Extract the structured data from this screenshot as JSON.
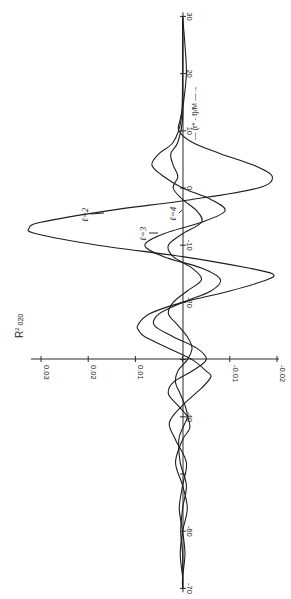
{
  "chart_data": {
    "type": "line",
    "orientation": "rotated-90-clockwise",
    "title": "",
    "xlabel": "(r* - t)/M",
    "xlabel_arrow": "→",
    "ylabel": "R² ω₂₀",
    "ylabel_display": {
      "base": "R",
      "sup": "2",
      "rest": " 020"
    },
    "xlim": [
      -70,
      30
    ],
    "ylim": [
      -0.02,
      0.03
    ],
    "x_ticks": [
      30,
      20,
      10,
      0,
      -10,
      -20,
      -30,
      -40,
      -50,
      -60,
      -70
    ],
    "x_tick_labels": [
      "30",
      "20",
      "10",
      "0",
      "-10",
      "-20",
      "",
      "-40",
      "",
      "-60",
      "-70"
    ],
    "y_ticks": [
      0.03,
      0.02,
      0.01,
      0,
      -0.01,
      -0.02
    ],
    "y_tick_labels": [
      "0.03",
      "0.02",
      "0.01",
      "",
      "-0.01",
      "-0.02"
    ],
    "grid": false,
    "legend": "inline annotations",
    "annotations": [
      {
        "text": "ℓ=2",
        "series": "l=2",
        "x": -5,
        "y": 0.017
      },
      {
        "text": "ℓ=3",
        "series": "l=3",
        "x": -9,
        "y": 0.0075
      },
      {
        "text": "ℓ=4",
        "series": "l=4",
        "x": -3,
        "y": 0.0025
      }
    ],
    "series": [
      {
        "name": "l=2",
        "x": [
          30,
          25,
          20,
          15,
          12,
          10,
          8,
          6,
          4,
          2,
          0,
          -2,
          -4,
          -6,
          -7,
          -8,
          -10,
          -12,
          -14,
          -15,
          -16,
          -18,
          -20,
          -22,
          -24,
          -25,
          -26,
          -28,
          -30,
          -32,
          -33,
          -35,
          -38,
          -41,
          -44,
          -48,
          -52,
          -56,
          -60,
          -64,
          -68,
          -70
        ],
        "y": [
          0.0,
          -0.0005,
          -0.0008,
          -0.0002,
          0.0005,
          0.0008,
          -0.002,
          -0.008,
          -0.015,
          -0.019,
          -0.016,
          -0.002,
          0.016,
          0.03,
          0.0325,
          0.031,
          0.018,
          0.0,
          -0.014,
          -0.019,
          -0.018,
          -0.01,
          0.0,
          0.007,
          0.0095,
          0.0092,
          0.008,
          0.003,
          -0.002,
          -0.005,
          -0.006,
          -0.004,
          0.0,
          0.0028,
          0.0015,
          -0.0008,
          0.0,
          0.0007,
          0.0,
          -0.0005,
          0.0,
          0.0
        ]
      },
      {
        "name": "l=3",
        "x": [
          30,
          20,
          12,
          8,
          6,
          4,
          2,
          0,
          -2,
          -4,
          -6,
          -8,
          -10,
          -12,
          -14,
          -16,
          -18,
          -20,
          -22,
          -24,
          -26,
          -28,
          -30,
          -32,
          -34,
          -36,
          -38,
          -40,
          -42,
          -44,
          -48,
          -52,
          -56,
          -60,
          -64,
          -68,
          -70
        ],
        "y": [
          0.0,
          0.0,
          0.0003,
          0.002,
          0.005,
          0.0065,
          0.004,
          0.0,
          -0.006,
          -0.009,
          -0.004,
          0.004,
          0.008,
          0.004,
          -0.004,
          -0.008,
          -0.006,
          0.0,
          0.005,
          0.006,
          0.002,
          -0.003,
          -0.005,
          -0.002,
          0.002,
          0.003,
          0.001,
          -0.001,
          -0.0015,
          0.0,
          0.0015,
          0.0,
          -0.001,
          0.0,
          0.0005,
          0.0,
          0.0
        ]
      },
      {
        "name": "l=4",
        "x": [
          30,
          20,
          12,
          8,
          6,
          4,
          2,
          0,
          -2,
          -4,
          -6,
          -8,
          -10,
          -12,
          -14,
          -16,
          -18,
          -20,
          -22,
          -24,
          -26,
          -28,
          -30,
          -32,
          -34,
          -36,
          -38,
          -40,
          -42,
          -44,
          -48,
          -52,
          -56,
          -60,
          -64,
          -68,
          -70
        ],
        "y": [
          0.0,
          0.0,
          0.0,
          0.001,
          0.0025,
          0.002,
          0.001,
          0.002,
          0.0,
          -0.003,
          -0.004,
          0.0,
          0.003,
          0.002,
          -0.002,
          -0.004,
          -0.001,
          0.002,
          0.003,
          0.001,
          -0.001,
          -0.002,
          -0.001,
          0.001,
          0.0015,
          0.0005,
          -0.0005,
          -0.001,
          0.0,
          0.0008,
          0.0005,
          -0.0008,
          0.0,
          0.0004,
          0.0,
          0.0,
          0.0
        ]
      }
    ]
  },
  "layout": {
    "axis_x_pixel": 183,
    "t_zero_pixel": 188,
    "px_per_t": 5.72,
    "value_zero_pixel": 182.6,
    "px_per_value": 4720,
    "value_axis_row": 359
  }
}
